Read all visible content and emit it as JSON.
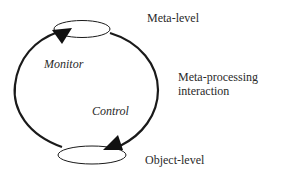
{
  "diagram": {
    "nodes": [
      {
        "id": "meta",
        "label": "Meta-level",
        "shape": "ellipse"
      },
      {
        "id": "object",
        "label": "Object-level",
        "shape": "ellipse"
      }
    ],
    "edges": [
      {
        "from": "object",
        "to": "meta",
        "label": "Monitor",
        "side": "left"
      },
      {
        "from": "meta",
        "to": "object",
        "label": "Control",
        "side": "right"
      }
    ],
    "annotation": {
      "line1": "Meta-processing",
      "line2": "interaction"
    },
    "colors": {
      "stroke": "#1a1a1a",
      "text": "#2a2a2a",
      "background": "#ffffff"
    }
  }
}
